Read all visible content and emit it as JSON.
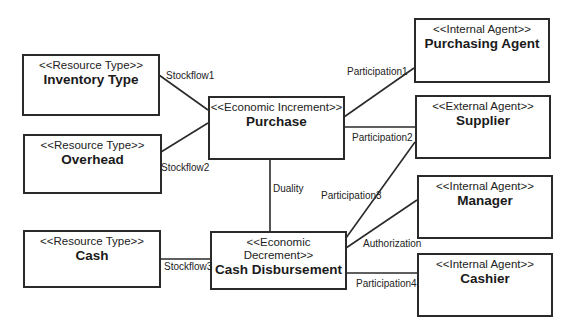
{
  "diagram": {
    "type": "REA model class diagram",
    "line_color": "#2a2a2a",
    "nodes": [
      {
        "id": "inventory",
        "stereotype": "<<Resource Type>>",
        "name": "Inventory Type"
      },
      {
        "id": "overhead",
        "stereotype": "<<Resource Type>>",
        "name": "Overhead"
      },
      {
        "id": "purchase",
        "stereotype": "<<Economic Increment>>",
        "name": "Purchase"
      },
      {
        "id": "cash",
        "stereotype": "<<Resource Type>>",
        "name": "Cash"
      },
      {
        "id": "disbursement",
        "stereotype": "<<Economic Decrement>>",
        "name": "Cash Disbursement"
      },
      {
        "id": "purchasing_agent",
        "stereotype": "<<Internal Agent>>",
        "name": "Purchasing Agent"
      },
      {
        "id": "supplier",
        "stereotype": "<<External Agent>>",
        "name": "Supplier"
      },
      {
        "id": "manager",
        "stereotype": "<<Internal Agent>>",
        "name": "Manager"
      },
      {
        "id": "cashier",
        "stereotype": "<<Internal Agent>>",
        "name": "Cashier"
      }
    ],
    "edges": [
      {
        "from": "inventory",
        "to": "purchase",
        "label": "Stockflow1"
      },
      {
        "from": "overhead",
        "to": "purchase",
        "label": "Stockflow2"
      },
      {
        "from": "purchase",
        "to": "purchasing_agent",
        "label": "Participation1"
      },
      {
        "from": "purchase",
        "to": "supplier",
        "label": "Participation2"
      },
      {
        "from": "purchase",
        "to": "disbursement",
        "label": "Duality"
      },
      {
        "from": "disbursement",
        "to": "supplier",
        "label": "Participation3"
      },
      {
        "from": "disbursement",
        "to": "manager",
        "label": "Authorization"
      },
      {
        "from": "cash",
        "to": "disbursement",
        "label": "Stockflow3"
      },
      {
        "from": "disbursement",
        "to": "cashier",
        "label": "Participation4"
      }
    ]
  }
}
